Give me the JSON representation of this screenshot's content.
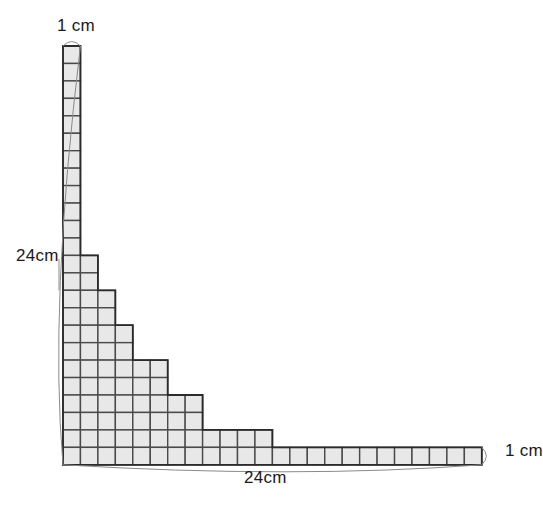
{
  "diagram": {
    "labels": {
      "top": "1 cm",
      "left": "24cm",
      "right": "1 cm",
      "bottom": "24cm"
    },
    "colors": {
      "fill": "#e8e8e8",
      "grid_stroke": "#4a4a4a",
      "outline_stroke": "#2b2b2b",
      "leader_stroke": "#8a8a8a",
      "text": "#1a1a1a",
      "background": "#ffffff"
    },
    "geometry": {
      "cell_px": 17.45,
      "origin_x": 63,
      "origin_y": 46,
      "rows": 24,
      "cols": 24,
      "unit": "cm",
      "side_length_cm": 24,
      "thickness_cm": 1
    },
    "chart_data": {
      "type": "table",
      "title": "Row widths of staircase (top row = 1)",
      "categories": [
        1,
        2,
        3,
        4,
        5,
        6,
        7,
        8,
        9,
        10,
        11,
        12,
        13,
        14,
        15,
        16,
        17,
        18,
        19,
        20,
        21,
        22,
        23,
        24
      ],
      "values": [
        1,
        1,
        1,
        1,
        1,
        1,
        1,
        1,
        1,
        1,
        1,
        1,
        2,
        2,
        3,
        3,
        4,
        4,
        6,
        6,
        8,
        8,
        12,
        24
      ],
      "xlabel": "row index from top",
      "ylabel": "width in squares"
    }
  }
}
